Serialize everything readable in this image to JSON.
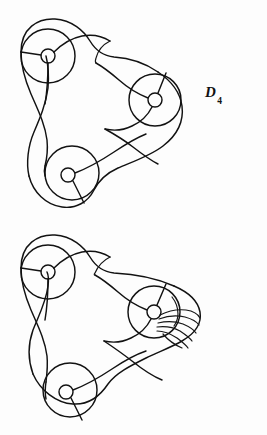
{
  "page": {
    "background_color": "#fdfdfd",
    "ink_color": "#121212",
    "width": 267,
    "height": 435
  },
  "figures": [
    {
      "id": "D4",
      "label_base": "D",
      "label_subscript": "4",
      "label_text": "D4",
      "caption_position": "right",
      "nodes": [
        {
          "name": "upper-left-disk",
          "cx": 48,
          "cy": 56,
          "r": 27,
          "hole_r": 7
        },
        {
          "name": "right-disk",
          "cx": 155,
          "cy": 100,
          "r": 26,
          "hole_r": 7
        },
        {
          "name": "lower-left-disk",
          "cx": 72,
          "cy": 173,
          "r": 27,
          "hole_r": 7
        }
      ]
    },
    {
      "id": "D5",
      "label_base": "D",
      "label_subscript": "5",
      "label_text": "D5",
      "caption_position": "right",
      "nodes": [
        {
          "name": "upper-left-disk",
          "cx": 48,
          "cy": 54,
          "r": 27,
          "hole_r": 7
        },
        {
          "name": "right-disk",
          "cx": 154,
          "cy": 94,
          "r": 26,
          "hole_r": 7
        },
        {
          "name": "lower-left-disk",
          "cx": 70,
          "cy": 272,
          "r": 27,
          "hole_r": 7
        }
      ],
      "extra_detail": {
        "name": "twist-fan",
        "strand_count": 5,
        "note": "fanned set of nested wavy arcs at the right disk indicating an extra twist"
      }
    }
  ],
  "labels": {
    "d4": {
      "base": "D",
      "sub": "4"
    },
    "d5": {
      "base": "D",
      "sub": "5"
    }
  }
}
